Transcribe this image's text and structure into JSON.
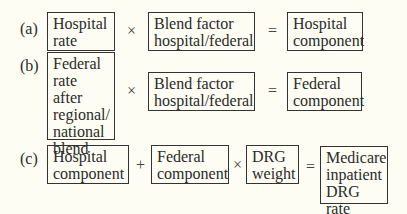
{
  "rows": [
    {
      "label": "(a)",
      "terms": [
        "Hospital\nrate",
        "Blend factor\nhospital/federal",
        "Hospital\ncomponent"
      ],
      "operators": [
        "×",
        "="
      ]
    },
    {
      "label": "(b)",
      "terms": [
        "Federal\nrate after\nregional/\nnational\nblend",
        "Blend factor\nhospital/federal",
        "Federal\ncomponent"
      ],
      "operators": [
        "×",
        "="
      ]
    },
    {
      "label": "(c)",
      "terms": [
        "Hospital\ncomponent",
        "Federal\ncomponent",
        "DRG\nweight",
        "Medicare\ninpatient\nDRG rate"
      ],
      "operators": [
        "+",
        "×",
        "="
      ]
    }
  ]
}
